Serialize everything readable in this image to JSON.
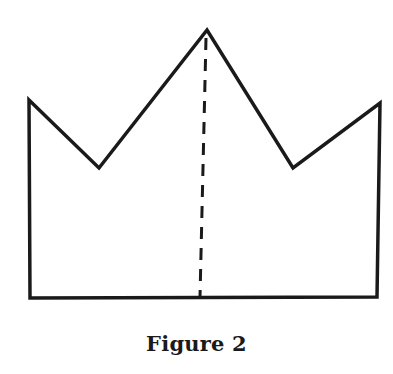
{
  "figure": {
    "caption": "Figure 2",
    "shape": "crown",
    "stroke_color": "#1a1a1a",
    "outline_points": [
      [
        29,
        100
      ],
      [
        99,
        168
      ],
      [
        207,
        30
      ],
      [
        293,
        168
      ],
      [
        380,
        103
      ],
      [
        377,
        297
      ],
      [
        30,
        298
      ]
    ],
    "fold_line": {
      "style": "dashed",
      "from": [
        206,
        38
      ],
      "to": [
        200,
        297
      ]
    }
  }
}
